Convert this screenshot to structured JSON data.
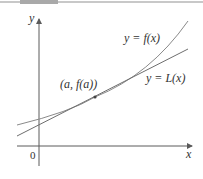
{
  "figure": {
    "axes": {
      "x_label": "x",
      "y_label": "y",
      "origin_label": "0"
    },
    "curves": [
      {
        "name": "f",
        "label": "y = f(x)",
        "color": "#8a8a8a"
      },
      {
        "name": "L",
        "label": "y = L(x)",
        "color": "#6e6e6e"
      }
    ],
    "point": {
      "label": "(a, f(a))"
    },
    "colors": {
      "axis": "#5a5a5a",
      "text": "#333333",
      "background": "#ffffff"
    }
  }
}
